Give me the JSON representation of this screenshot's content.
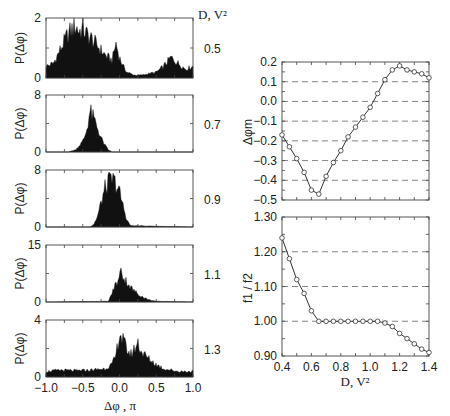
{
  "figure": {
    "left_column_header": "D, V²",
    "left_xlabel": "Δφ , π",
    "left_ylabel": "P(Δφ)",
    "right_xlabel": "D, V²",
    "right_top_ylabel": "Δφm",
    "right_bottom_ylabel": "f1 / f2"
  },
  "chart_data": [
    {
      "type": "area",
      "title": "Histogram P(Δφ), D = 0.5 V²",
      "panel_label": "0.5",
      "xlabel": "Δφ , π",
      "ylabel": "P(Δφ)",
      "xlim": [
        -1.0,
        1.0
      ],
      "ylim": [
        0,
        2
      ],
      "yticks": [
        "0",
        "2"
      ],
      "x": [
        -1.0,
        -0.9,
        -0.8,
        -0.7,
        -0.6,
        -0.55,
        -0.5,
        -0.45,
        -0.4,
        -0.3,
        -0.2,
        -0.1,
        -0.05,
        0.0,
        0.05,
        0.1,
        0.2,
        0.3,
        0.4,
        0.5,
        0.6,
        0.7,
        0.8,
        0.9,
        1.0
      ],
      "values": [
        0.4,
        0.5,
        1.0,
        1.5,
        1.8,
        1.6,
        1.7,
        1.5,
        1.4,
        1.1,
        0.8,
        0.6,
        1.2,
        0.7,
        0.4,
        0.2,
        0.1,
        0.1,
        0.15,
        0.2,
        0.4,
        0.7,
        0.5,
        0.3,
        0.4
      ]
    },
    {
      "type": "area",
      "title": "Histogram P(Δφ), D = 0.7 V²",
      "panel_label": "0.7",
      "xlim": [
        -1.0,
        1.0
      ],
      "ylim": [
        0,
        8
      ],
      "yticks": [
        "0",
        "8"
      ],
      "x": [
        -1.0,
        -0.7,
        -0.6,
        -0.5,
        -0.45,
        -0.4,
        -0.35,
        -0.3,
        -0.25,
        -0.2,
        -0.15,
        -0.1,
        1.0
      ],
      "values": [
        0,
        0,
        0.3,
        1.5,
        3.0,
        5.9,
        4.8,
        3.5,
        2.0,
        1.0,
        0.3,
        0,
        0
      ]
    },
    {
      "type": "area",
      "title": "Histogram P(Δφ), D = 0.9 V²",
      "panel_label": "0.9",
      "xlim": [
        -1.0,
        1.0
      ],
      "ylim": [
        0,
        8
      ],
      "yticks": [
        "0",
        "8"
      ],
      "x": [
        -1.0,
        -0.4,
        -0.35,
        -0.3,
        -0.25,
        -0.2,
        -0.15,
        -0.1,
        -0.05,
        0.0,
        0.05,
        0.1,
        0.15,
        1.0
      ],
      "values": [
        0,
        0,
        0.4,
        1.5,
        3.5,
        5.5,
        6.5,
        6.8,
        6.3,
        5.0,
        3.0,
        1.0,
        0.2,
        0
      ]
    },
    {
      "type": "area",
      "title": "Histogram P(Δφ), D = 1.1 V²",
      "panel_label": "1.1",
      "xlim": [
        -1.0,
        1.0
      ],
      "ylim": [
        0,
        15
      ],
      "yticks": [
        "0",
        "15"
      ],
      "x": [
        -1.0,
        -0.15,
        -0.1,
        -0.05,
        0.0,
        0.02,
        0.05,
        0.1,
        0.15,
        0.2,
        0.3,
        0.4,
        0.5,
        1.0
      ],
      "values": [
        0,
        0.2,
        2.5,
        5.0,
        6.0,
        10.5,
        6.5,
        5.5,
        4.0,
        3.0,
        1.5,
        0.6,
        0.2,
        0
      ]
    },
    {
      "type": "area",
      "title": "Histogram P(Δφ), D = 1.3 V²",
      "panel_label": "1.3",
      "xlim": [
        -1.0,
        1.0
      ],
      "ylim": [
        0,
        4
      ],
      "yticks": [
        "0",
        "4"
      ],
      "xticks": [
        "-1.0",
        "-0.5",
        "0.0",
        "0.5",
        "1.0"
      ],
      "x": [
        -1.0,
        -0.8,
        -0.6,
        -0.4,
        -0.2,
        -0.1,
        -0.05,
        0.0,
        0.05,
        0.1,
        0.15,
        0.2,
        0.25,
        0.3,
        0.4,
        0.5,
        0.6,
        0.8,
        1.0
      ],
      "values": [
        0.4,
        0.5,
        0.45,
        0.5,
        0.6,
        0.9,
        1.5,
        3.2,
        2.6,
        2.0,
        1.6,
        2.0,
        2.5,
        1.8,
        1.3,
        0.9,
        0.6,
        0.4,
        0.4
      ]
    },
    {
      "type": "line",
      "title": "Δφm vs D",
      "xlabel": "D, V²",
      "ylabel": "Δφm",
      "xlim": [
        0.4,
        1.4
      ],
      "ylim": [
        -0.5,
        0.2
      ],
      "yticks": [
        "0.2",
        "0.1",
        "0.0",
        "-0.1",
        "-0.2",
        "-0.3",
        "-0.4",
        "-0.5"
      ],
      "grid": "dashed horizontal",
      "x": [
        0.4,
        0.45,
        0.5,
        0.55,
        0.6,
        0.65,
        0.7,
        0.75,
        0.8,
        0.85,
        0.9,
        0.95,
        1.0,
        1.05,
        1.1,
        1.15,
        1.2,
        1.25,
        1.3,
        1.35,
        1.4
      ],
      "values": [
        -0.17,
        -0.23,
        -0.29,
        -0.36,
        -0.45,
        -0.47,
        -0.38,
        -0.31,
        -0.25,
        -0.18,
        -0.13,
        -0.08,
        -0.03,
        0.04,
        0.11,
        0.16,
        0.18,
        0.16,
        0.15,
        0.14,
        0.12
      ]
    },
    {
      "type": "line",
      "title": "f1 / f2 vs D",
      "xlabel": "D, V²",
      "ylabel": "f1 / f2",
      "xlim": [
        0.4,
        1.4
      ],
      "ylim": [
        0.9,
        1.3
      ],
      "yticks": [
        "1.30",
        "1.20",
        "1.10",
        "1.00",
        "0.90"
      ],
      "xticks": [
        "0.4",
        "0.6",
        "0.8",
        "1.0",
        "1.2",
        "1.4"
      ],
      "grid": "dashed horizontal",
      "x": [
        0.4,
        0.45,
        0.5,
        0.55,
        0.6,
        0.65,
        0.7,
        0.75,
        0.8,
        0.85,
        0.9,
        0.95,
        1.0,
        1.05,
        1.1,
        1.15,
        1.2,
        1.25,
        1.3,
        1.35,
        1.4
      ],
      "values": [
        1.24,
        1.18,
        1.12,
        1.08,
        1.03,
        1.0,
        1.0,
        1.0,
        1.0,
        1.0,
        1.0,
        1.0,
        1.0,
        1.0,
        0.995,
        0.985,
        0.965,
        0.95,
        0.935,
        0.92,
        0.91
      ]
    }
  ]
}
